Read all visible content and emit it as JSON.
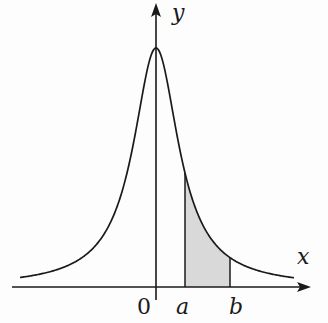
{
  "diagram": {
    "title": "",
    "axes": {
      "x_label": "x",
      "y_label": "y",
      "origin_label": "0"
    },
    "markers": {
      "a_label": "a",
      "b_label": "b"
    },
    "colors": {
      "curve": "#1a1a1a",
      "axes": "#1a1a1a",
      "shade": "#d9d9d9",
      "background": "#fdfdfd"
    }
  }
}
